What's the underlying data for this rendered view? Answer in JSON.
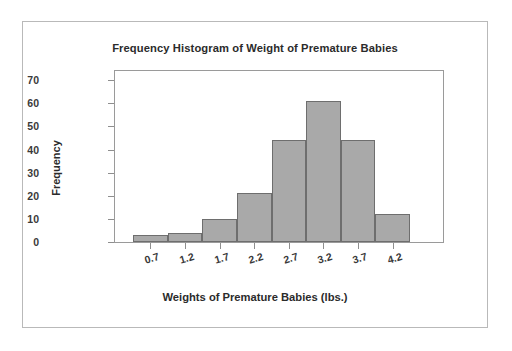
{
  "chart_data": {
    "type": "bar",
    "title": "Frequency Histogram of Weight of Premature Babies",
    "xlabel": "Weights of Premature Babies (lbs.)",
    "ylabel": "Frequency",
    "categories": [
      "0.7",
      "1.2",
      "1.7",
      "2.2",
      "2.7",
      "3.2",
      "3.7",
      "4.2"
    ],
    "values": [
      3,
      4,
      10,
      21,
      44,
      61,
      44,
      12
    ],
    "ylim": [
      0,
      74
    ],
    "yticks": [
      0,
      10,
      20,
      30,
      40,
      50,
      60,
      70
    ],
    "ytick_labels": [
      "0",
      "10",
      "20",
      "30",
      "40",
      "50",
      "60",
      "70"
    ],
    "xtick_labels": [
      "0.7",
      "1.2",
      "1.7",
      "2.2",
      "2.7",
      "3.2",
      "3.7",
      "4.2"
    ],
    "grid": false,
    "legend": null,
    "bar_fill_color": "#a9a9a9",
    "bar_border_color": "#6e6e6e",
    "axis_color": "#9a9a9a",
    "text_color": "#2b2b2b"
  }
}
